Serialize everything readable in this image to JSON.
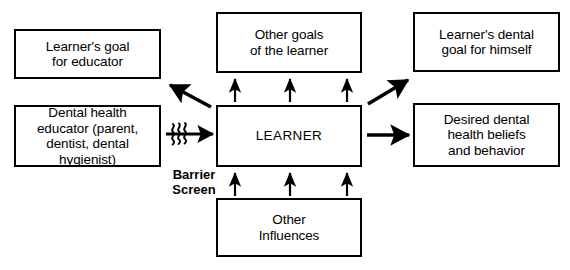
{
  "diagram": {
    "type": "flow-diagram",
    "stroke_color": "#000000",
    "background_color": "#ffffff",
    "nodes": [
      {
        "id": "learner-goal-educator",
        "label": "Learner's goal\nfor educator",
        "column": "left",
        "row": "top"
      },
      {
        "id": "dental-health-educator",
        "label": "Dental health\neducator (parent,\ndentist, dental\nhygienist)",
        "column": "left",
        "row": "middle"
      },
      {
        "id": "other-goals",
        "label": "Other goals\nof the learner",
        "column": "center",
        "row": "top"
      },
      {
        "id": "learner",
        "label": "LEARNER",
        "column": "center",
        "row": "middle"
      },
      {
        "id": "other-influences",
        "label": "Other\nInfluences",
        "column": "center",
        "row": "bottom"
      },
      {
        "id": "learner-dental-goal",
        "label": "Learner's dental\ngoal for himself",
        "column": "right",
        "row": "top"
      },
      {
        "id": "desired-beliefs",
        "label": "Desired dental\nhealth beliefs\nand behavior",
        "column": "right",
        "row": "middle"
      }
    ],
    "edges": [
      {
        "id": "educator-to-learner",
        "from": "dental-health-educator",
        "to": "learner",
        "style": "arrow-with-barrier",
        "label": "Barrier\nScreen"
      },
      {
        "id": "learner-to-learner-goal-educator",
        "from": "learner",
        "to": "learner-goal-educator",
        "style": "diagonal-arrow"
      },
      {
        "id": "learner-to-other-goals-1",
        "from": "learner",
        "to": "other-goals",
        "style": "up-arrow"
      },
      {
        "id": "learner-to-other-goals-2",
        "from": "learner",
        "to": "other-goals",
        "style": "up-arrow"
      },
      {
        "id": "learner-to-other-goals-3",
        "from": "learner",
        "to": "other-goals",
        "style": "up-arrow"
      },
      {
        "id": "other-influences-to-learner-1",
        "from": "other-influences",
        "to": "learner",
        "style": "up-arrow"
      },
      {
        "id": "other-influences-to-learner-2",
        "from": "other-influences",
        "to": "learner",
        "style": "up-arrow"
      },
      {
        "id": "other-influences-to-learner-3",
        "from": "other-influences",
        "to": "learner",
        "style": "up-arrow"
      },
      {
        "id": "learner-to-learner-dental-goal",
        "from": "learner",
        "to": "learner-dental-goal",
        "style": "diagonal-arrow"
      },
      {
        "id": "learner-to-desired-beliefs",
        "from": "learner",
        "to": "desired-beliefs",
        "style": "horizontal-arrow"
      }
    ]
  }
}
